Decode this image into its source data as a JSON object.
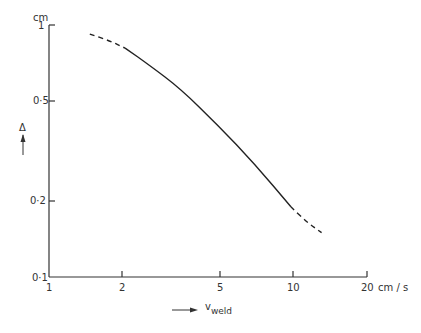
{
  "chart_data": {
    "type": "line",
    "title": "",
    "xlabel": "v_weld",
    "xlabel_main": "v",
    "xlabel_sub": "weld",
    "x_unit": "cm / s",
    "ylabel": "Δ",
    "y_unit": "cm",
    "xscale": "log",
    "yscale": "log",
    "xlim": [
      1,
      20
    ],
    "ylim": [
      0.1,
      1
    ],
    "x_ticks": [
      1,
      2,
      5,
      10,
      20
    ],
    "x_tick_labels": [
      "1",
      "2",
      "5",
      "10",
      "20"
    ],
    "y_ticks": [
      0.1,
      0.2,
      0.5,
      1
    ],
    "y_tick_labels": [
      "0·1",
      "0·2",
      "0·5",
      "1"
    ],
    "grid": false,
    "legend": null,
    "series": [
      {
        "name": "Δ vs v_weld",
        "segments": [
          {
            "style": "dashed",
            "x": [
              1.47,
              1.75,
              2.05
            ],
            "y": [
              0.92,
              0.87,
              0.81
            ]
          },
          {
            "style": "solid",
            "x": [
              2.05,
              2.59,
              3.45,
              4.93,
              6.98,
              9.8
            ],
            "y": [
              0.81,
              0.69,
              0.56,
              0.4,
              0.28,
              0.19
            ]
          },
          {
            "style": "dashed",
            "x": [
              9.8,
              11.4,
              13.1
            ],
            "y": [
              0.19,
              0.165,
              0.15
            ]
          }
        ]
      }
    ]
  },
  "labels": {
    "y_unit": "cm",
    "y_symbol": "Δ",
    "x_unit": "cm / s",
    "x_main": "v",
    "x_sub": "weld",
    "x_ticks": [
      "1",
      "2",
      "5",
      "10",
      "20"
    ],
    "y_ticks": [
      "1",
      "0·5",
      "0·2",
      "0·1"
    ]
  }
}
